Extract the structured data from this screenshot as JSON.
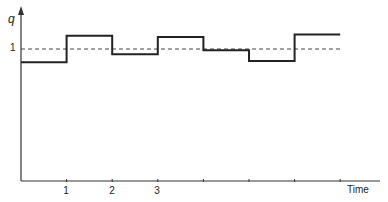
{
  "chart_data": {
    "type": "line",
    "style": "step",
    "title": "",
    "xlabel": "Time",
    "ylabel": "q",
    "xticks": [
      {
        "pos": 1,
        "label": "1"
      },
      {
        "pos": 2,
        "label": "2"
      },
      {
        "pos": 3,
        "label": "3"
      },
      {
        "pos": 4,
        "label": ""
      },
      {
        "pos": 5,
        "label": ""
      },
      {
        "pos": 6,
        "label": ""
      },
      {
        "pos": 7,
        "label": ""
      }
    ],
    "yticks": [
      {
        "pos": 1,
        "label": "1"
      }
    ],
    "reference_line": {
      "y": 1,
      "style": "dashed",
      "label": "1"
    },
    "xlim": [
      0,
      7.8
    ],
    "ylim": [
      0,
      1.3
    ],
    "grid": false,
    "legend": null,
    "series": [
      {
        "name": "q",
        "segments": [
          {
            "x0": 0,
            "x1": 1,
            "y": 0.9
          },
          {
            "x0": 1,
            "x1": 2,
            "y": 1.1
          },
          {
            "x0": 2,
            "x1": 3,
            "y": 0.96
          },
          {
            "x0": 3,
            "x1": 4,
            "y": 1.09
          },
          {
            "x0": 4,
            "x1": 5,
            "y": 0.99
          },
          {
            "x0": 5,
            "x1": 6,
            "y": 0.91
          },
          {
            "x0": 6,
            "x1": 7,
            "y": 1.11
          }
        ]
      }
    ]
  },
  "labels": {
    "y_axis": "q",
    "y_ref": "1",
    "x_axis": "Time",
    "ticks": [
      "1",
      "2",
      "3"
    ]
  },
  "colors": {
    "line": "#222222",
    "axis": "#333333",
    "dash": "#444444"
  }
}
